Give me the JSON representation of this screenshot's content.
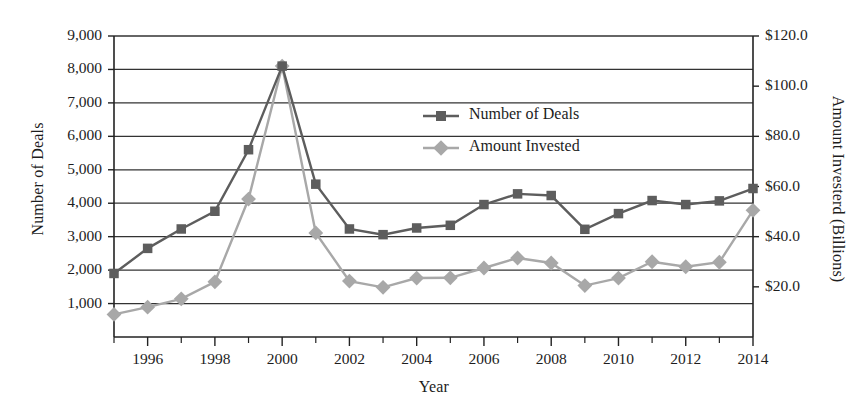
{
  "chart_data": {
    "type": "line",
    "title": "",
    "xlabel": "Year",
    "ylabel": "Number of Deals",
    "y2label": "Amount Investerd (Billions)",
    "grid": true,
    "legend_position": "inside-upper-right",
    "x": [
      1995,
      1996,
      1997,
      1998,
      1999,
      2000,
      2001,
      2002,
      2003,
      2004,
      2005,
      2006,
      2007,
      2008,
      2009,
      2010,
      2011,
      2012,
      2013,
      2014
    ],
    "xlim": [
      1995,
      2014
    ],
    "xticks": [
      1996,
      1998,
      2000,
      2002,
      2004,
      2006,
      2008,
      2010,
      2012,
      2014
    ],
    "xtick_labels": [
      "1996",
      "1998",
      "2000",
      "2002",
      "2004",
      "2006",
      "2008",
      "2010",
      "2012",
      "2014"
    ],
    "xminor_ticks": [
      1995,
      1997,
      1999,
      2001,
      2003,
      2005,
      2007,
      2009,
      2011,
      2013
    ],
    "ylim": [
      0,
      9000
    ],
    "yticks": [
      1000,
      2000,
      3000,
      4000,
      5000,
      6000,
      7000,
      8000,
      9000
    ],
    "ytick_labels": [
      "1,000",
      "2,000",
      "3,000",
      "4,000",
      "5,000",
      "6,000",
      "7,000",
      "8,000",
      "9,000"
    ],
    "y2lim": [
      0,
      120
    ],
    "y2ticks": [
      20,
      40,
      60,
      80,
      100,
      120
    ],
    "y2tick_labels": [
      "$20.0",
      "$40.0",
      "$60.0",
      "$80.0",
      "$100.0",
      "$120.0"
    ],
    "series": [
      {
        "name": "Number of Deals",
        "axis": "left",
        "color": "#5d5d5d",
        "marker": "square",
        "values": [
          1900,
          2650,
          3230,
          3760,
          5600,
          8100,
          4570,
          3230,
          3060,
          3260,
          3340,
          3960,
          4280,
          4230,
          3220,
          3690,
          4080,
          3960,
          4070,
          4440
        ]
      },
      {
        "name": "Amount Invested",
        "axis": "right",
        "color": "#a8a8a8",
        "marker": "diamond",
        "values": [
          9.0,
          11.9,
          15.2,
          22.0,
          55.0,
          108.0,
          41.5,
          22.3,
          19.8,
          23.5,
          23.6,
          27.5,
          31.5,
          29.5,
          20.5,
          23.5,
          30.0,
          28.0,
          29.8,
          50.5
        ]
      }
    ]
  },
  "legend": {
    "items": [
      {
        "label": "Number of Deals",
        "color": "#5d5d5d",
        "marker": "square"
      },
      {
        "label": "Amount Invested",
        "color": "#a8a8a8",
        "marker": "diamond"
      }
    ]
  },
  "axis_titles": {
    "left": "Number of Deals",
    "right": "Amount Investerd (Billions)",
    "bottom": "Year"
  }
}
